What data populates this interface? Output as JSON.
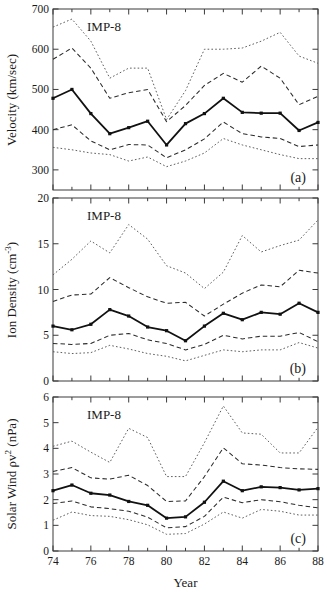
{
  "figure": {
    "xlabel": "Year",
    "x_tick_labels": [
      "74",
      "76",
      "78",
      "80",
      "82",
      "84",
      "86",
      "88"
    ],
    "x_tick_values": [
      74,
      76,
      78,
      80,
      82,
      84,
      86,
      88
    ],
    "x_minor_step": 1,
    "xlim": [
      74,
      88
    ],
    "annotation": "IMP-8"
  },
  "chart_data": [
    {
      "type": "line",
      "panel": "a",
      "panel_label": "(a)",
      "title": "",
      "annotation": "IMP-8",
      "xlabel": "",
      "ylabel": "Velocity (km/sec)",
      "xlim": [
        74,
        88
      ],
      "ylim": [
        250,
        700
      ],
      "y_tick_values": [
        300,
        400,
        500,
        600,
        700
      ],
      "y_tick_labels": [
        "300",
        "400",
        "500",
        "600",
        "700"
      ],
      "grid": false,
      "legend": "none",
      "x": [
        74,
        75,
        76,
        77,
        78,
        79,
        80,
        81,
        82,
        83,
        84,
        85,
        86,
        87,
        88
      ],
      "series": [
        {
          "name": "upper-decile",
          "style": "dotted",
          "values": [
            655,
            675,
            620,
            528,
            553,
            553,
            425,
            497,
            600,
            600,
            603,
            620,
            642,
            583,
            565
          ]
        },
        {
          "name": "upper-quartile",
          "style": "dashed",
          "values": [
            575,
            603,
            553,
            478,
            492,
            500,
            420,
            460,
            510,
            540,
            518,
            558,
            528,
            462,
            483
          ]
        },
        {
          "name": "median",
          "style": "solid",
          "markers": true,
          "values": [
            478,
            500,
            440,
            390,
            405,
            421,
            362,
            415,
            440,
            478,
            443,
            441,
            441,
            398,
            418
          ]
        },
        {
          "name": "lower-quartile",
          "style": "dashed",
          "values": [
            400,
            412,
            372,
            350,
            363,
            362,
            330,
            350,
            377,
            419,
            390,
            382,
            378,
            358,
            362
          ]
        },
        {
          "name": "lower-decile",
          "style": "dotted",
          "values": [
            356,
            350,
            342,
            338,
            322,
            332,
            308,
            322,
            342,
            378,
            362,
            350,
            338,
            328,
            328
          ]
        }
      ]
    },
    {
      "type": "line",
      "panel": "b",
      "panel_label": "(b)",
      "title": "",
      "annotation": "IMP-8",
      "xlabel": "",
      "ylabel": "Ion Density (cm-3)",
      "xlim": [
        74,
        88
      ],
      "ylim": [
        0,
        20
      ],
      "y_tick_values": [
        0,
        5,
        10,
        15,
        20
      ],
      "y_tick_labels": [
        "0",
        "5",
        "10",
        "15",
        "20"
      ],
      "grid": false,
      "legend": "none",
      "x": [
        74,
        75,
        76,
        77,
        78,
        79,
        80,
        81,
        82,
        83,
        84,
        85,
        86,
        87,
        88
      ],
      "series": [
        {
          "name": "upper-decile",
          "style": "dotted",
          "values": [
            11.6,
            13.3,
            15.3,
            14.0,
            17.1,
            15.5,
            12.6,
            11.8,
            10.1,
            11.9,
            15.9,
            14.1,
            14.8,
            15.4,
            17.6
          ]
        },
        {
          "name": "upper-quartile",
          "style": "dashed",
          "values": [
            8.7,
            9.4,
            9.5,
            11.3,
            10.2,
            9.2,
            8.5,
            8.6,
            7.1,
            8.4,
            9.6,
            10.5,
            10.3,
            12.1,
            11.8
          ]
        },
        {
          "name": "median",
          "style": "solid",
          "markers": true,
          "values": [
            6.0,
            5.6,
            6.2,
            7.8,
            7.1,
            5.9,
            5.5,
            4.4,
            6.0,
            7.4,
            6.7,
            7.5,
            7.3,
            8.5,
            7.5
          ]
        },
        {
          "name": "lower-quartile",
          "style": "dashed",
          "values": [
            4.1,
            4.0,
            4.1,
            5.0,
            5.2,
            4.5,
            4.1,
            3.4,
            4.0,
            5.0,
            4.6,
            4.9,
            4.9,
            5.3,
            4.3
          ]
        },
        {
          "name": "lower-decile",
          "style": "dotted",
          "values": [
            3.2,
            3.0,
            3.1,
            3.9,
            3.5,
            3.0,
            2.7,
            2.2,
            2.8,
            3.4,
            3.2,
            3.4,
            3.4,
            4.2,
            3.6
          ]
        }
      ]
    },
    {
      "type": "line",
      "panel": "c",
      "panel_label": "(c)",
      "title": "",
      "annotation": "IMP-8",
      "xlabel": "Year",
      "ylabel": "Solar Wind pv2 (nPa)",
      "xlim": [
        74,
        88
      ],
      "ylim": [
        0,
        6
      ],
      "y_tick_values": [
        0,
        1,
        2,
        3,
        4,
        5,
        6
      ],
      "y_tick_labels": [
        "0",
        "1",
        "2",
        "3",
        "4",
        "5",
        "6"
      ],
      "grid": false,
      "legend": "none",
      "x": [
        74,
        75,
        76,
        77,
        78,
        79,
        80,
        81,
        82,
        83,
        84,
        85,
        86,
        87,
        88
      ],
      "series": [
        {
          "name": "upper-decile",
          "style": "dotted",
          "values": [
            4.08,
            4.28,
            3.85,
            3.45,
            4.78,
            4.42,
            2.9,
            2.9,
            4.22,
            5.65,
            4.6,
            4.55,
            3.82,
            3.82,
            4.82
          ]
        },
        {
          "name": "upper-quartile",
          "style": "dashed",
          "values": [
            3.1,
            3.25,
            2.85,
            2.8,
            2.95,
            2.55,
            1.93,
            1.95,
            2.9,
            4.02,
            3.4,
            3.35,
            3.25,
            3.2,
            3.18
          ]
        },
        {
          "name": "median",
          "style": "solid",
          "markers": true,
          "values": [
            2.35,
            2.57,
            2.25,
            2.18,
            1.93,
            1.78,
            1.28,
            1.33,
            1.9,
            2.72,
            2.35,
            2.5,
            2.47,
            2.38,
            2.43
          ]
        },
        {
          "name": "lower-quartile",
          "style": "dashed",
          "values": [
            1.85,
            1.95,
            1.72,
            1.65,
            1.55,
            1.32,
            0.9,
            0.95,
            1.35,
            2.1,
            1.88,
            2.0,
            1.92,
            1.78,
            1.68
          ]
        },
        {
          "name": "lower-decile",
          "style": "dotted",
          "values": [
            1.2,
            1.52,
            1.38,
            1.35,
            1.22,
            1.02,
            0.65,
            0.68,
            1.05,
            1.52,
            1.28,
            1.62,
            1.55,
            1.4,
            1.4
          ]
        }
      ]
    }
  ]
}
